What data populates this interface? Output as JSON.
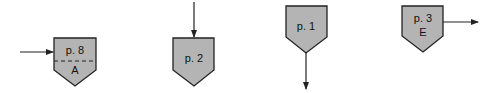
{
  "diagram": {
    "type": "off-page connectors",
    "colors": {
      "fill": "#b4b4b4",
      "stroke": "#222222",
      "background": "#ffffff"
    },
    "connectors": [
      {
        "id": "c1",
        "page_label": "p. 8",
        "sub_label": "A",
        "has_divider": true,
        "arrow": "incoming-left"
      },
      {
        "id": "c2",
        "page_label": "p. 2",
        "sub_label": "",
        "has_divider": false,
        "arrow": "incoming-top"
      },
      {
        "id": "c3",
        "page_label": "p. 1",
        "sub_label": "",
        "has_divider": false,
        "arrow": "outgoing-bottom"
      },
      {
        "id": "c4",
        "page_label": "p. 3",
        "sub_label": "E",
        "has_divider": false,
        "arrow": "outgoing-right"
      }
    ]
  }
}
